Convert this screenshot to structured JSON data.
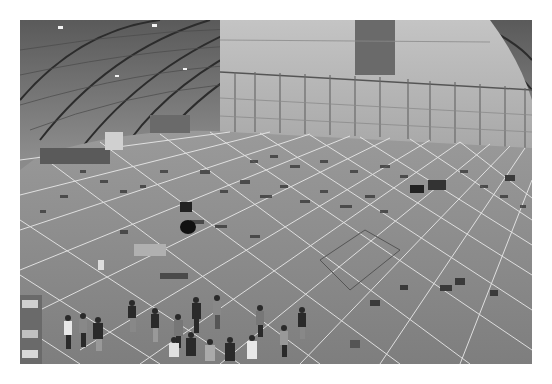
{
  "image": {
    "description": "Grayscale wide-angle photograph of a large arched hangar interior with a gridded floor covered in laid-out debris pieces; a group of people stands in the foreground",
    "palette": {
      "background": "#ffffff",
      "ceiling_dark": "#3c3c3c",
      "ceiling_light": "#9a9a9a",
      "wall": "#b8b8b8",
      "floor": "#8a8a8a",
      "grid_line": "#e6e6e6",
      "debris": "#3a3a3a"
    }
  }
}
